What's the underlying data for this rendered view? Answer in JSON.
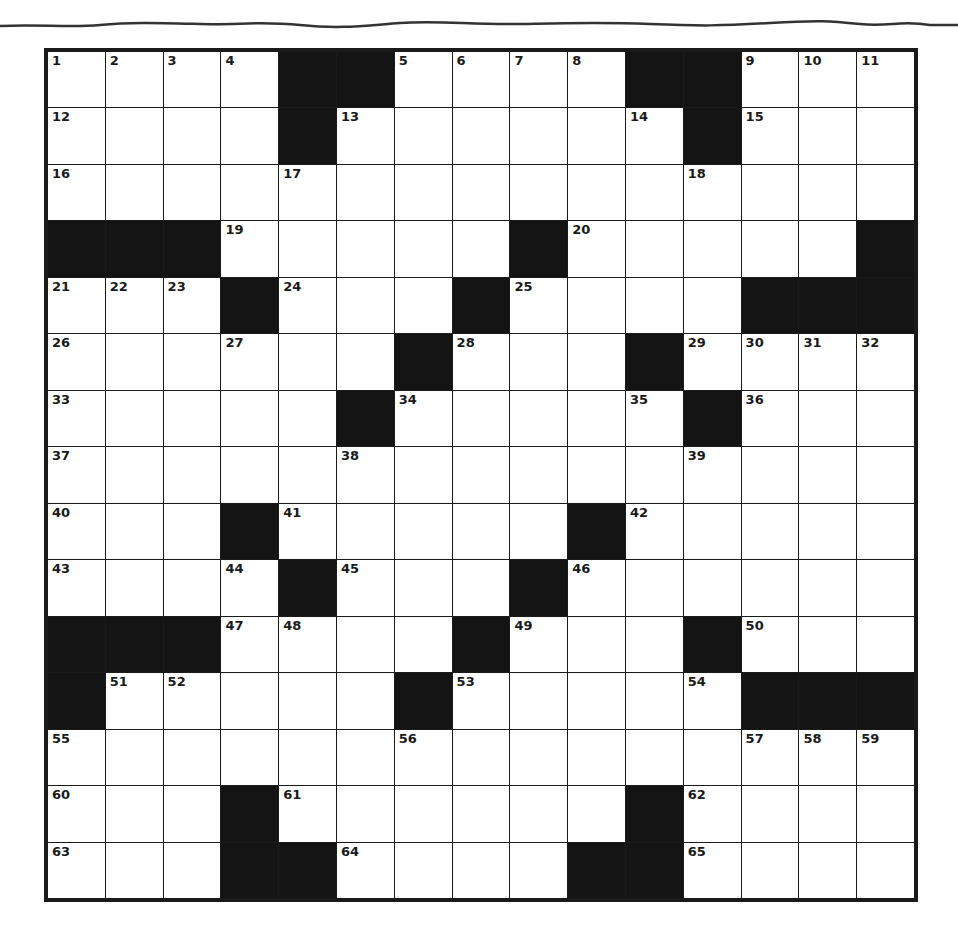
{
  "puzzle": {
    "rows": 15,
    "cols": 15,
    "layout": [
      "....##....##...",
      "....#......#...",
      "...............",
      "###.....#.....#",
      "...#...#....###",
      "......#...#....",
      ".....#.....#...",
      "...............",
      "...#.....#.....",
      "....#...#......",
      "###....#...#...",
      "#.....#.....###",
      "...............",
      "...#......#....",
      "...##....##...."
    ],
    "numbers": {
      "0,0": "1",
      "0,1": "2",
      "0,2": "3",
      "0,3": "4",
      "0,6": "5",
      "0,7": "6",
      "0,8": "7",
      "0,9": "8",
      "0,12": "9",
      "0,13": "10",
      "0,14": "11",
      "1,0": "12",
      "1,5": "13",
      "1,10": "14",
      "1,12": "15",
      "2,0": "16",
      "2,4": "17",
      "2,11": "18",
      "3,3": "19",
      "3,9": "20",
      "4,0": "21",
      "4,1": "22",
      "4,2": "23",
      "4,4": "24",
      "4,8": "25",
      "5,0": "26",
      "5,3": "27",
      "5,7": "28",
      "5,11": "29",
      "5,12": "30",
      "5,13": "31",
      "5,14": "32",
      "6,0": "33",
      "6,6": "34",
      "6,10": "35",
      "6,12": "36",
      "7,0": "37",
      "7,5": "38",
      "7,11": "39",
      "8,0": "40",
      "8,4": "41",
      "8,10": "42",
      "9,0": "43",
      "9,3": "44",
      "9,5": "45",
      "9,9": "46",
      "10,3": "47",
      "10,4": "48",
      "10,8": "49",
      "10,12": "50",
      "11,1": "51",
      "11,2": "52",
      "11,7": "53",
      "11,11": "54",
      "12,0": "55",
      "12,6": "56",
      "12,12": "57",
      "12,13": "58",
      "12,14": "59",
      "13,0": "60",
      "13,4": "61",
      "13,11": "62",
      "14,0": "63",
      "14,5": "64",
      "14,11": "65"
    }
  }
}
